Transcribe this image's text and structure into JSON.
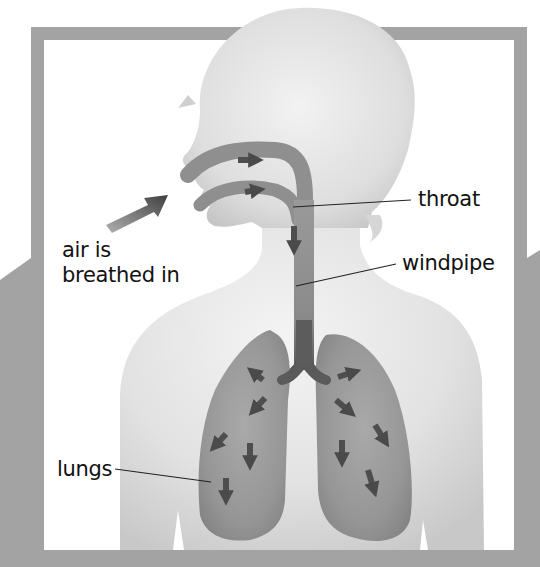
{
  "diagram": {
    "colors": {
      "frame": "#a3a3a3",
      "background": "#ffffff",
      "body": "#dcdcdc",
      "airway": "#8a8a8a",
      "arrow": "#505050",
      "leader_line": "#222222"
    },
    "labels": {
      "air_in_line1": "air is",
      "air_in_line2": "breathed in",
      "throat": "throat",
      "windpipe": "windpipe",
      "lungs": "lungs"
    }
  }
}
